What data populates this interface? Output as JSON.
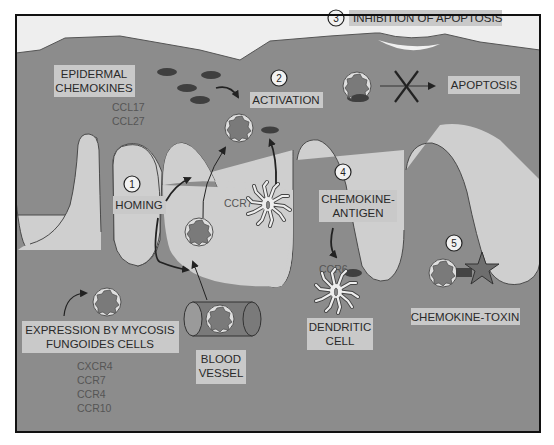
{
  "diagram": {
    "colors": {
      "frame": "#111111",
      "background_white": "#eeeeee",
      "tissue_dark": "#8a8a8a",
      "papilla_light": "#cdcdcd",
      "label_box": "#c9c9c9",
      "cell_fill": "#777777",
      "cell_ring": "#d4d4d4",
      "chemokine": "#3f3f3f",
      "toxin_star": "#6e6e6e",
      "arrow": "#2a2a2a"
    },
    "steps": [
      {
        "number": "1",
        "label": "HOMING"
      },
      {
        "number": "2",
        "label": "ACTIVATION"
      },
      {
        "number": "3",
        "label": "INHIBITION OF APOPTOSIS"
      },
      {
        "number": "4",
        "label_line1": "CHEMOKINE-",
        "label_line2": "ANTIGEN"
      },
      {
        "number": "5",
        "label": "CHEMOKINE-TOXIN"
      }
    ],
    "epidermal_chemokines": {
      "label_line1": "EPIDERMAL",
      "label_line2": "CHEMOKINES",
      "items": [
        "CCL17",
        "CCL27"
      ]
    },
    "apoptosis_label": "APOPTOSIS",
    "receptor_ccr7": "CCR7",
    "receptor_ccr6": "CCR6",
    "dendritic_cell": {
      "line1": "DENDRITIC",
      "line2": "CELL"
    },
    "blood_vessel": {
      "line1": "BLOOD",
      "line2": "VESSEL"
    },
    "expression": {
      "line1": "EXPRESSION BY MYCOSIS",
      "line2": "FUNGOIDES CELLS",
      "receptors": [
        "CXCR4",
        "CCR7",
        "CCR4",
        "CCR10"
      ]
    },
    "icons": {
      "mf_cell": "lymphocyte-cell-icon",
      "chemokine": "chemokine-oval-icon",
      "dendritic": "dendritic-cell-icon",
      "blocked": "x-block-icon",
      "toxin": "star-toxin-icon",
      "vessel": "cylinder-vessel-icon"
    }
  }
}
